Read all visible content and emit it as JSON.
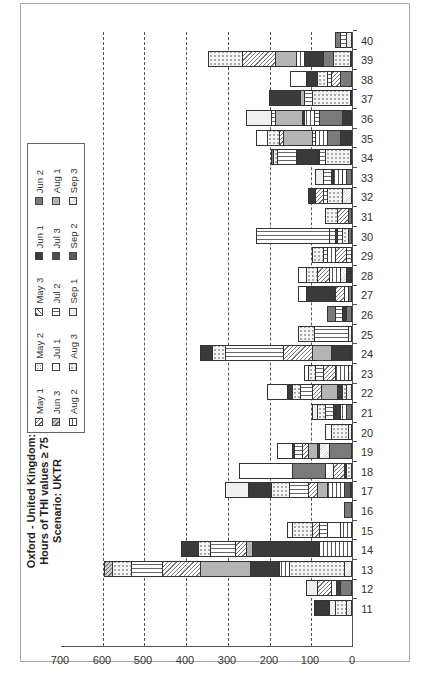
{
  "chart_data": {
    "type": "bar",
    "stacked": true,
    "orientation_in_image": "rotated 90deg counter-clockwise",
    "title": "Oxford - United Kingdom: Hours of THI values ≥ 75 Scenario: UKTR",
    "title_lines": [
      "Oxford - United Kingdom:",
      "Hours of THI values ≥ 75",
      "Scenario: UKTR"
    ],
    "xlabel": "",
    "ylabel": "",
    "ylim": [
      0,
      700
    ],
    "yticks": [
      0,
      100,
      200,
      300,
      400,
      500,
      600,
      700
    ],
    "grid": "dashed horizontal at 100-600",
    "legend_position": "top-right (inside plot)",
    "categories": [
      "11",
      "12",
      "13",
      "14",
      "15",
      "16",
      "17",
      "18",
      "19",
      "20",
      "21",
      "22",
      "23",
      "24",
      "25",
      "26",
      "27",
      "28",
      "29",
      "30",
      "31",
      "32",
      "33",
      "34",
      "35",
      "36",
      "37",
      "38",
      "39",
      "40"
    ],
    "totals": [
      90,
      110,
      595,
      410,
      155,
      20,
      305,
      272,
      180,
      65,
      95,
      205,
      115,
      365,
      130,
      60,
      130,
      160,
      95,
      230,
      65,
      105,
      90,
      195,
      230,
      255,
      200,
      150,
      345,
      40
    ],
    "series_names": [
      "May 1",
      "May 2",
      "May 3",
      "Jun 1",
      "Jun 2",
      "Jun 3",
      "Jul 1",
      "Jul 2",
      "Jul 3",
      "Aug 1",
      "Aug 2",
      "Aug 3",
      "Sep 1",
      "Sep 2",
      "Sep 3"
    ],
    "segments": [
      [
        [
          "Sep 3",
          15
        ],
        [
          "Aug 3",
          25
        ],
        [
          "Sep 1",
          15
        ],
        [
          "Jun 1",
          35
        ]
      ],
      [
        [
          "Jun 2",
          30
        ],
        [
          "Jun 1",
          8
        ],
        [
          "Jul 1",
          12
        ],
        [
          "May 1",
          35
        ],
        [
          "Sep 1",
          25
        ]
      ],
      [
        [
          "Sep 3",
          20
        ],
        [
          "Aug 3",
          130
        ],
        [
          "Aug 2",
          25
        ],
        [
          "Jun 1",
          70
        ],
        [
          "Aug 1",
          120
        ],
        [
          "May 1",
          90
        ],
        [
          "Jul 2",
          75
        ],
        [
          "Aug 3",
          45
        ],
        [
          "Jun 3",
          20
        ]
      ],
      [
        [
          "Aug 2",
          80
        ],
        [
          "Jun 1",
          160
        ],
        [
          "Aug 1",
          15
        ],
        [
          "May 1",
          25
        ],
        [
          "Jul 2",
          60
        ],
        [
          "Aug 3",
          30
        ],
        [
          "Jun 1",
          40
        ]
      ],
      [
        [
          "Aug 2",
          30
        ],
        [
          "Jul 1",
          30
        ],
        [
          "Jul 2",
          20
        ],
        [
          "May 1",
          15
        ],
        [
          "Aug 3",
          50
        ],
        [
          "Jul 1",
          10
        ]
      ],
      [
        [
          "Jun 2",
          20
        ]
      ],
      [
        [
          "Sep 3",
          5
        ],
        [
          "Sep 2",
          15
        ],
        [
          "Aug 2",
          40
        ],
        [
          "Aug 1",
          25
        ],
        [
          "May 1",
          20
        ],
        [
          "Jul 2",
          45
        ],
        [
          "Aug 3",
          45
        ],
        [
          "Jun 1",
          55
        ],
        [
          "Sep 1",
          55
        ]
      ],
      [
        [
          "Aug 3",
          15
        ],
        [
          "Jun 1",
          5
        ],
        [
          "May 1",
          25
        ],
        [
          "Jul 1",
          20
        ],
        [
          "Jun 2",
          80
        ],
        [
          "Jul 1",
          127
        ]
      ],
      [
        [
          "Jun 2",
          55
        ],
        [
          "Sep 3",
          25
        ],
        [
          "Jun 1",
          5
        ],
        [
          "Aug 1",
          20
        ],
        [
          "May 1",
          15
        ],
        [
          "Jul 2",
          20
        ],
        [
          "Jun 1",
          5
        ],
        [
          "Jul 1",
          35
        ]
      ],
      [
        [
          "Sep 3",
          10
        ],
        [
          "Aug 3",
          40
        ],
        [
          "Jul 1",
          15
        ]
      ],
      [
        [
          "Jun 2",
          15
        ],
        [
          "Aug 2",
          15
        ],
        [
          "Jun 1",
          15
        ],
        [
          "Jul 2",
          20
        ],
        [
          "Aug 3",
          20
        ],
        [
          "Sep 1",
          10
        ]
      ],
      [
        [
          "Sep 3",
          15
        ],
        [
          "Aug 3",
          10
        ],
        [
          "Jun 1",
          10
        ],
        [
          "Aug 1",
          40
        ],
        [
          "May 1",
          20
        ],
        [
          "Jul 2",
          30
        ],
        [
          "Aug 3",
          20
        ],
        [
          "Jun 1",
          10
        ],
        [
          "Jul 1",
          50
        ]
      ],
      [
        [
          "Sep 3",
          10
        ],
        [
          "Aug 2",
          30
        ],
        [
          "May 1",
          30
        ],
        [
          "Jul 2",
          20
        ],
        [
          "Aug 3",
          15
        ],
        [
          "Jul 1",
          10
        ]
      ],
      [
        [
          "Aug 3",
          5
        ],
        [
          "Jun 1",
          45
        ],
        [
          "Aug 1",
          45
        ],
        [
          "May 1",
          70
        ],
        [
          "Jul 2",
          140
        ],
        [
          "Aug 3",
          30
        ],
        [
          "Jun 1",
          30
        ]
      ],
      [
        [
          "Sep 3",
          10
        ],
        [
          "Jul 2",
          80
        ],
        [
          "Aug 3",
          40
        ]
      ],
      [
        [
          "Jun 2",
          15
        ],
        [
          "Jun 1",
          10
        ],
        [
          "Jul 2",
          15
        ],
        [
          "Jun 2",
          20
        ]
      ],
      [
        [
          "Jun 2",
          10
        ],
        [
          "Jul 1",
          10
        ],
        [
          "May 1",
          20
        ],
        [
          "Jun 1",
          70
        ],
        [
          "Jul 1",
          20
        ]
      ],
      [
        [
          "Jun 1",
          15
        ],
        [
          "Sep 3",
          15
        ],
        [
          "Aug 2",
          25
        ],
        [
          "May 1",
          30
        ],
        [
          "Aug 3",
          25
        ],
        [
          "Jul 1",
          20
        ]
      ],
      [
        [
          "Jul 2",
          15
        ],
        [
          "May 1",
          25
        ],
        [
          "Aug 2",
          20
        ],
        [
          "Jul 2",
          10
        ],
        [
          "Aug 3",
          25
        ]
      ],
      [
        [
          "Jun 2",
          10
        ],
        [
          "Aug 3",
          15
        ],
        [
          "Jul 2",
          10
        ],
        [
          "Jun 1",
          5
        ],
        [
          "Jul 2",
          15
        ],
        [
          "Jul 2",
          175
        ]
      ],
      [
        [
          "Jun 2",
          10
        ],
        [
          "May 1",
          25
        ],
        [
          "Aug 3",
          30
        ]
      ],
      [
        [
          "Sep 3",
          25
        ],
        [
          "Aug 3",
          35
        ],
        [
          "Jul 2",
          10
        ],
        [
          "May 1",
          20
        ],
        [
          "Jun 1",
          15
        ]
      ],
      [
        [
          "Jun 2",
          15
        ],
        [
          "Jul 1",
          10
        ],
        [
          "Aug 2",
          20
        ],
        [
          "Jun 1",
          5
        ],
        [
          "Jul 2",
          20
        ],
        [
          "Sep 1",
          20
        ]
      ],
      [
        [
          "Jun 2",
          5
        ],
        [
          "Aug 3",
          60
        ],
        [
          "Jul 2",
          15
        ],
        [
          "Jun 1",
          5
        ],
        [
          "Jun 1",
          50
        ],
        [
          "Jul 2",
          45
        ],
        [
          "Aug 3",
          10
        ],
        [
          "Jun 2",
          5
        ]
      ],
      [
        [
          "Jun 1",
          30
        ],
        [
          "Jun 2",
          30
        ],
        [
          "Aug 2",
          30
        ],
        [
          "Jul 2",
          5
        ],
        [
          "Aug 1",
          70
        ],
        [
          "May 1",
          10
        ],
        [
          "Aug 3",
          30
        ],
        [
          "Jul 1",
          25
        ]
      ],
      [
        [
          "Jun 1",
          25
        ],
        [
          "Jun 2",
          55
        ],
        [
          "Jul 2",
          10
        ],
        [
          "Aug 2",
          25
        ],
        [
          "Jun 1",
          5
        ],
        [
          "Aug 1",
          65
        ],
        [
          "Jul 2",
          10
        ],
        [
          "Sep 1",
          60
        ]
      ],
      [
        [
          "Jul 2",
          5
        ],
        [
          "Aug 3",
          90
        ],
        [
          "Jul 2",
          20
        ],
        [
          "Aug 1",
          10
        ],
        [
          "Jun 1",
          75
        ]
      ],
      [
        [
          "Jun 2",
          30
        ],
        [
          "May 1",
          20
        ],
        [
          "Jul 2",
          10
        ],
        [
          "Aug 3",
          25
        ],
        [
          "Jun 1",
          25
        ],
        [
          "Jul 1",
          40
        ]
      ],
      [
        [
          "Jun 2",
          5
        ],
        [
          "Aug 3",
          40
        ],
        [
          "Jun 2",
          25
        ],
        [
          "Jun 1",
          45
        ],
        [
          "Aug 2",
          20
        ],
        [
          "Aug 1",
          50
        ],
        [
          "May 1",
          80
        ],
        [
          "Aug 3",
          80
        ]
      ],
      [
        [
          "Sep 3",
          15
        ],
        [
          "Jul 2",
          15
        ],
        [
          "Jun 2",
          10
        ]
      ]
    ]
  },
  "chart": {
    "title_lines": [
      "Oxford - United Kingdom:",
      "Hours of THI values ≥ 75",
      "Scenario: UKTR"
    ],
    "yticks": [
      "0",
      "100",
      "200",
      "300",
      "400",
      "500",
      "600",
      "700"
    ],
    "xticks": [
      "11",
      "12",
      "13",
      "14",
      "15",
      "16",
      "17",
      "18",
      "19",
      "20",
      "21",
      "22",
      "23",
      "24",
      "25",
      "26",
      "27",
      "28",
      "29",
      "30",
      "31",
      "32",
      "33",
      "34",
      "35",
      "36",
      "37",
      "38",
      "39",
      "40"
    ],
    "legend": [
      {
        "label": "May 1",
        "cls": "p-may1"
      },
      {
        "label": "May 2",
        "cls": "p-may2"
      },
      {
        "label": "May 3",
        "cls": "p-may3"
      },
      {
        "label": "Jun 1",
        "cls": "p-jun1"
      },
      {
        "label": "Jun 2",
        "cls": "p-jun2"
      },
      {
        "label": "Jun 3",
        "cls": "p-jun3"
      },
      {
        "label": "Jul 1",
        "cls": "p-jul1"
      },
      {
        "label": "Jul 2",
        "cls": "p-jul2"
      },
      {
        "label": "Jul 3",
        "cls": "p-jul3"
      },
      {
        "label": "Aug 1",
        "cls": "p-aug1"
      },
      {
        "label": "Aug 2",
        "cls": "p-aug2"
      },
      {
        "label": "Aug 3",
        "cls": "p-aug3"
      },
      {
        "label": "Sep 1",
        "cls": "p-sep1"
      },
      {
        "label": "Sep 2",
        "cls": "p-sep2"
      },
      {
        "label": "Sep 3",
        "cls": "p-sep3"
      }
    ]
  }
}
